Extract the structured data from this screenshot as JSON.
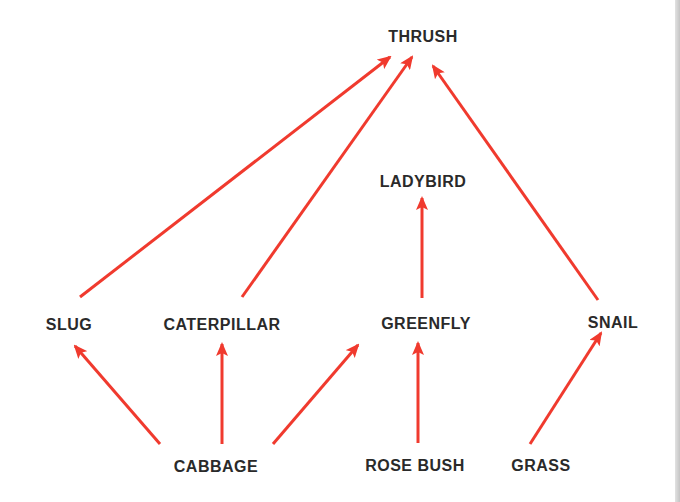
{
  "diagram": {
    "type": "food-web",
    "arrow_color": "#f03a2e",
    "text_color": "#2a2a2a",
    "nodes": [
      {
        "id": "thrush",
        "label": "THRUSH",
        "x": 423,
        "y": 37
      },
      {
        "id": "ladybird",
        "label": "LADYBIRD",
        "x": 423,
        "y": 182
      },
      {
        "id": "slug",
        "label": "SLUG",
        "x": 69,
        "y": 325
      },
      {
        "id": "caterpillar",
        "label": "CATERPILLAR",
        "x": 222,
        "y": 325
      },
      {
        "id": "greenfly",
        "label": "GREENFLY",
        "x": 426,
        "y": 324
      },
      {
        "id": "snail",
        "label": "SNAIL",
        "x": 613,
        "y": 323
      },
      {
        "id": "cabbage",
        "label": "CABBAGE",
        "x": 216,
        "y": 467
      },
      {
        "id": "rose_bush",
        "label": "ROSE BUSH",
        "x": 415,
        "y": 466
      },
      {
        "id": "grass",
        "label": "GRASS",
        "x": 541,
        "y": 466
      }
    ],
    "edges": [
      {
        "from": "slug",
        "to": "thrush",
        "x1": 80,
        "y1": 297,
        "x2": 390,
        "y2": 57
      },
      {
        "from": "caterpillar",
        "to": "thrush",
        "x1": 242,
        "y1": 297,
        "x2": 412,
        "y2": 57
      },
      {
        "from": "snail",
        "to": "thrush",
        "x1": 598,
        "y1": 300,
        "x2": 433,
        "y2": 66
      },
      {
        "from": "greenfly",
        "to": "ladybird",
        "x1": 422,
        "y1": 298,
        "x2": 422,
        "y2": 198
      },
      {
        "from": "cabbage",
        "to": "slug",
        "x1": 160,
        "y1": 444,
        "x2": 75,
        "y2": 346
      },
      {
        "from": "cabbage",
        "to": "caterpillar",
        "x1": 222,
        "y1": 444,
        "x2": 222,
        "y2": 344
      },
      {
        "from": "cabbage",
        "to": "greenfly",
        "x1": 273,
        "y1": 444,
        "x2": 358,
        "y2": 345
      },
      {
        "from": "rose_bush",
        "to": "greenfly",
        "x1": 418,
        "y1": 443,
        "x2": 418,
        "y2": 343
      },
      {
        "from": "grass",
        "to": "snail",
        "x1": 530,
        "y1": 444,
        "x2": 601,
        "y2": 333
      }
    ]
  }
}
